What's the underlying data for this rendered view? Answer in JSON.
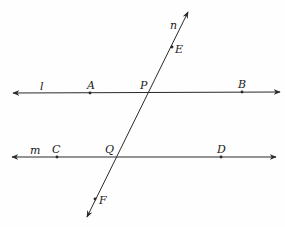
{
  "diagram": {
    "colors": {
      "line": "#2a2a2a",
      "text": "#1a1a1a",
      "background": "#fefefe"
    },
    "lines": [
      {
        "name": "l",
        "label": "l",
        "x1": 13,
        "y1": 93,
        "x2": 280,
        "y2": 92,
        "label_x": 40,
        "label_y": 90
      },
      {
        "name": "m",
        "label": "m",
        "x1": 12,
        "y1": 157,
        "x2": 276,
        "y2": 157,
        "label_x": 30,
        "label_y": 154
      },
      {
        "name": "n",
        "label": "n",
        "x1": 188,
        "y1": 12,
        "x2": 87,
        "y2": 217,
        "label_x": 170,
        "label_y": 29
      }
    ],
    "points": [
      {
        "label": "A",
        "x": 90,
        "y": 93,
        "label_x": 87,
        "label_y": 89,
        "dot": true
      },
      {
        "label": "B",
        "x": 242,
        "y": 92,
        "label_x": 238,
        "label_y": 88,
        "dot": true
      },
      {
        "label": "P",
        "x": 148,
        "y": 93,
        "label_x": 140,
        "label_y": 89,
        "dot": false
      },
      {
        "label": "C",
        "x": 57,
        "y": 157,
        "label_x": 52,
        "label_y": 153,
        "dot": true
      },
      {
        "label": "D",
        "x": 221,
        "y": 157,
        "label_x": 217,
        "label_y": 153,
        "dot": true
      },
      {
        "label": "Q",
        "x": 116,
        "y": 157,
        "label_x": 105,
        "label_y": 153,
        "dot": false
      },
      {
        "label": "E",
        "x": 172,
        "y": 47,
        "label_x": 175,
        "label_y": 53,
        "dot": true
      },
      {
        "label": "F",
        "x": 95,
        "y": 199,
        "label_x": 99,
        "label_y": 204,
        "dot": true
      }
    ]
  }
}
